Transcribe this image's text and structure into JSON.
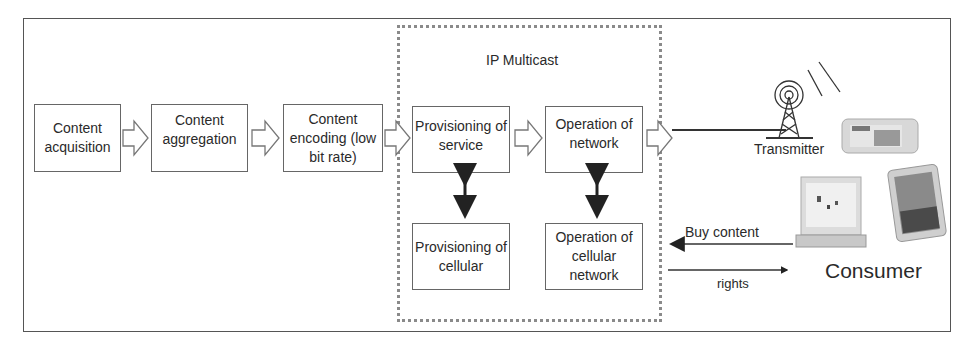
{
  "diagram": {
    "group_label": "IP Multicast",
    "pipeline": [
      {
        "id": "content-acquisition",
        "label": "Content acquisition"
      },
      {
        "id": "content-aggregation",
        "label": "Content aggregation"
      },
      {
        "id": "content-encoding",
        "label": "Content encoding (low bit rate)"
      },
      {
        "id": "provisioning-of-service",
        "label": "Provisioning of service"
      },
      {
        "id": "operation-of-network",
        "label": "Operation of network"
      }
    ],
    "lower": [
      {
        "id": "provisioning-of-cellular",
        "label": "Provisioning of cellular"
      },
      {
        "id": "operation-of-cellular-network",
        "label": "Operation of cellular network"
      }
    ],
    "transmitter_label": "Transmitter",
    "consumer_label": "Consumer",
    "buy_content_label": "Buy content",
    "rights_label": "rights",
    "edges": [
      {
        "from": "content-acquisition",
        "to": "content-aggregation",
        "style": "block-arrow"
      },
      {
        "from": "content-aggregation",
        "to": "content-encoding",
        "style": "block-arrow"
      },
      {
        "from": "content-encoding",
        "to": "provisioning-of-service",
        "style": "block-arrow"
      },
      {
        "from": "provisioning-of-service",
        "to": "operation-of-network",
        "style": "block-arrow"
      },
      {
        "from": "operation-of-network",
        "to": "transmitter",
        "style": "block-arrow-line"
      },
      {
        "from": "provisioning-of-service",
        "to": "provisioning-of-cellular",
        "style": "bidirectional"
      },
      {
        "from": "operation-of-network",
        "to": "operation-of-cellular-network",
        "style": "bidirectional"
      },
      {
        "from": "consumer",
        "to": "operation-of-cellular-network",
        "label": "Buy content"
      },
      {
        "from": "operation-of-cellular-network",
        "to": "consumer",
        "label": "rights"
      }
    ]
  }
}
